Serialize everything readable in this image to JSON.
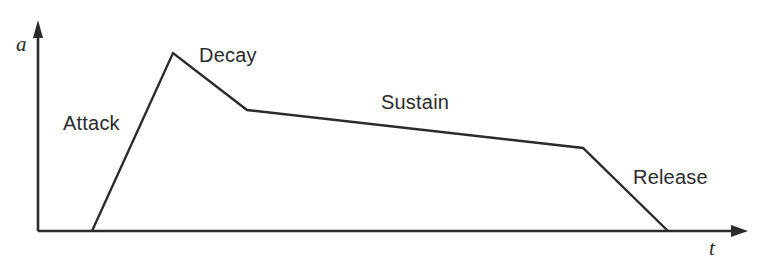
{
  "figure": {
    "type": "adsr-envelope-diagram",
    "background_color": "#ffffff",
    "stroke_color": "#2b2b2b",
    "axes": {
      "y": {
        "label": "a",
        "arrow": "up",
        "x": 38,
        "base_y": 231,
        "tip_y": 20
      },
      "x": {
        "label": "t",
        "arrow": "right",
        "y": 231,
        "start_x": 38,
        "tip_x": 748
      }
    },
    "labels": {
      "attack": "Attack",
      "decay": "Decay",
      "sustain": "Sustain",
      "release": "Release",
      "amplitude_axis": "a",
      "time_axis": "t"
    }
  },
  "chart_data": {
    "type": "line",
    "title": "",
    "xlabel": "t",
    "ylabel": "a",
    "grid": false,
    "legend": "none",
    "xlim": [
      38,
      748
    ],
    "ylim": [
      231,
      20
    ],
    "annotations": [
      {
        "text": "Attack",
        "x": 63,
        "y": 125
      },
      {
        "text": "Decay",
        "x": 199,
        "y": 57
      },
      {
        "text": "Sustain",
        "x": 381,
        "y": 104
      },
      {
        "text": "Release",
        "x": 633,
        "y": 179
      }
    ],
    "series": [
      {
        "name": "ADSR envelope",
        "points": [
          {
            "x": 92,
            "y": 231,
            "phase": "start"
          },
          {
            "x": 173,
            "y": 53,
            "phase": "attack-peak"
          },
          {
            "x": 247,
            "y": 110,
            "phase": "decay-end"
          },
          {
            "x": 583,
            "y": 148,
            "phase": "sustain-end"
          },
          {
            "x": 668,
            "y": 231,
            "phase": "release-end"
          }
        ],
        "segments": [
          {
            "phase": "Attack",
            "from": [
              92,
              231
            ],
            "to": [
              173,
              53
            ]
          },
          {
            "phase": "Decay",
            "from": [
              173,
              53
            ],
            "to": [
              247,
              110
            ]
          },
          {
            "phase": "Sustain",
            "from": [
              247,
              110
            ],
            "to": [
              583,
              148
            ]
          },
          {
            "phase": "Release",
            "from": [
              583,
              148
            ],
            "to": [
              668,
              231
            ]
          }
        ]
      }
    ]
  }
}
